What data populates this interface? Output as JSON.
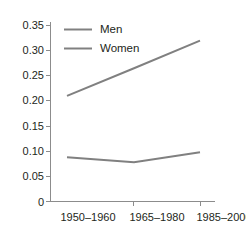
{
  "chart_data": {
    "type": "line",
    "title": "",
    "subtitle": "",
    "xlabel": "",
    "ylabel": "",
    "categories": [
      "1950–1960",
      "1965–1980",
      "1985–2000"
    ],
    "series": [
      {
        "name": "Men",
        "values": [
          0.21,
          0.265,
          0.32
        ],
        "color": "#808080"
      },
      {
        "name": "Women",
        "values": [
          0.088,
          0.078,
          0.098
        ],
        "color": "#808080"
      }
    ],
    "ylim": [
      0,
      0.35
    ],
    "ytick_labels": [
      "0.35",
      "0.30",
      "0.25",
      "0.20",
      "0.15",
      "0.10",
      "0.05",
      "0"
    ],
    "ytick_values": [
      0.35,
      0.3,
      0.25,
      0.2,
      0.15,
      0.1,
      0.05,
      0
    ],
    "grid": false,
    "legend_position": "top-center",
    "legend_entries": [
      "Men",
      "Women"
    ]
  },
  "axes": {
    "axis_color": "#8c8c8c",
    "text_color": "#231f20"
  },
  "legend": {
    "men_label": "Men",
    "women_label": "Women"
  }
}
